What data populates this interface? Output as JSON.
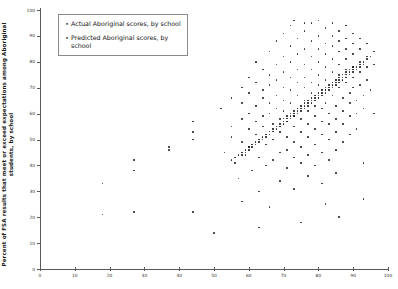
{
  "chart_data": {
    "type": "scatter",
    "title": "",
    "xlabel": "",
    "ylabel": "Percent of FSA results that meet or exceed expectations among Aboriginal students, by school",
    "xlim": [
      0,
      100
    ],
    "ylim": [
      0,
      100
    ],
    "xticks": [
      0,
      10,
      20,
      30,
      40,
      50,
      60,
      70,
      80,
      90,
      100
    ],
    "yticks": [
      0,
      10,
      20,
      30,
      40,
      50,
      60,
      70,
      80,
      90,
      100
    ],
    "grid": false,
    "legend_position": "upper-left",
    "series": [
      {
        "name": "Actual Aboriginal scores, by school",
        "marker": "dot",
        "color": "#2b2b2b",
        "points": [
          [
            18,
            33
          ],
          [
            18,
            21
          ],
          [
            27,
            42
          ],
          [
            27,
            38
          ],
          [
            27,
            22
          ],
          [
            37,
            47
          ],
          [
            37,
            46
          ],
          [
            44,
            57
          ],
          [
            44,
            53
          ],
          [
            44,
            50
          ],
          [
            44,
            22
          ],
          [
            52,
            62
          ],
          [
            53,
            45
          ],
          [
            55,
            66
          ],
          [
            55,
            55
          ],
          [
            55,
            51
          ],
          [
            56,
            41
          ],
          [
            57,
            35
          ],
          [
            58,
            70
          ],
          [
            58,
            64
          ],
          [
            58,
            58
          ],
          [
            58,
            49
          ],
          [
            59,
            44
          ],
          [
            60,
            74
          ],
          [
            60,
            68
          ],
          [
            60,
            60
          ],
          [
            60,
            54
          ],
          [
            60,
            47
          ],
          [
            61,
            38
          ],
          [
            62,
            80
          ],
          [
            62,
            72
          ],
          [
            62,
            63
          ],
          [
            62,
            57
          ],
          [
            62,
            52
          ],
          [
            63,
            43
          ],
          [
            63,
            30
          ],
          [
            64,
            77
          ],
          [
            64,
            69
          ],
          [
            64,
            66
          ],
          [
            64,
            59
          ],
          [
            64,
            55
          ],
          [
            65,
            48
          ],
          [
            65,
            40
          ],
          [
            66,
            84
          ],
          [
            66,
            75
          ],
          [
            66,
            71
          ],
          [
            66,
            64
          ],
          [
            66,
            60
          ],
          [
            67,
            56
          ],
          [
            67,
            50
          ],
          [
            67,
            42
          ],
          [
            68,
            88
          ],
          [
            68,
            79
          ],
          [
            68,
            73
          ],
          [
            68,
            67
          ],
          [
            68,
            62
          ],
          [
            69,
            58
          ],
          [
            69,
            53
          ],
          [
            69,
            45
          ],
          [
            69,
            34
          ],
          [
            70,
            91
          ],
          [
            70,
            82
          ],
          [
            70,
            76
          ],
          [
            70,
            70
          ],
          [
            70,
            65
          ],
          [
            70,
            61
          ],
          [
            71,
            57
          ],
          [
            71,
            51
          ],
          [
            71,
            46
          ],
          [
            71,
            39
          ],
          [
            72,
            94
          ],
          [
            72,
            86
          ],
          [
            72,
            80
          ],
          [
            72,
            74
          ],
          [
            72,
            69
          ],
          [
            72,
            64
          ],
          [
            73,
            59
          ],
          [
            73,
            55
          ],
          [
            73,
            49
          ],
          [
            73,
            43
          ],
          [
            73,
            31
          ],
          [
            74,
            89
          ],
          [
            74,
            83
          ],
          [
            74,
            77
          ],
          [
            74,
            72
          ],
          [
            74,
            67
          ],
          [
            74,
            62
          ],
          [
            75,
            58
          ],
          [
            75,
            53
          ],
          [
            75,
            47
          ],
          [
            75,
            41
          ],
          [
            76,
            92
          ],
          [
            76,
            85
          ],
          [
            76,
            79
          ],
          [
            76,
            74
          ],
          [
            76,
            70
          ],
          [
            76,
            65
          ],
          [
            77,
            61
          ],
          [
            77,
            56
          ],
          [
            77,
            51
          ],
          [
            77,
            44
          ],
          [
            77,
            36
          ],
          [
            78,
            95
          ],
          [
            78,
            88
          ],
          [
            78,
            82
          ],
          [
            78,
            77
          ],
          [
            78,
            72
          ],
          [
            78,
            68
          ],
          [
            79,
            63
          ],
          [
            79,
            59
          ],
          [
            79,
            54
          ],
          [
            79,
            48
          ],
          [
            79,
            40
          ],
          [
            80,
            96
          ],
          [
            80,
            90
          ],
          [
            80,
            85
          ],
          [
            80,
            80
          ],
          [
            80,
            75
          ],
          [
            80,
            71
          ],
          [
            80,
            66
          ],
          [
            81,
            62
          ],
          [
            81,
            57
          ],
          [
            81,
            52
          ],
          [
            81,
            45
          ],
          [
            81,
            33
          ],
          [
            82,
            93
          ],
          [
            82,
            87
          ],
          [
            82,
            83
          ],
          [
            82,
            78
          ],
          [
            82,
            73
          ],
          [
            82,
            69
          ],
          [
            82,
            64
          ],
          [
            83,
            60
          ],
          [
            83,
            56
          ],
          [
            83,
            50
          ],
          [
            83,
            42
          ],
          [
            84,
            95
          ],
          [
            84,
            90
          ],
          [
            84,
            86
          ],
          [
            84,
            81
          ],
          [
            84,
            76
          ],
          [
            84,
            72
          ],
          [
            84,
            67
          ],
          [
            85,
            63
          ],
          [
            85,
            58
          ],
          [
            85,
            53
          ],
          [
            85,
            46
          ],
          [
            85,
            37
          ],
          [
            86,
            92
          ],
          [
            86,
            88
          ],
          [
            86,
            84
          ],
          [
            86,
            79
          ],
          [
            86,
            75
          ],
          [
            86,
            70
          ],
          [
            87,
            66
          ],
          [
            87,
            61
          ],
          [
            87,
            56
          ],
          [
            87,
            49
          ],
          [
            88,
            94
          ],
          [
            88,
            89
          ],
          [
            88,
            85
          ],
          [
            88,
            81
          ],
          [
            88,
            77
          ],
          [
            88,
            72
          ],
          [
            89,
            68
          ],
          [
            89,
            64
          ],
          [
            89,
            59
          ],
          [
            89,
            52
          ],
          [
            90,
            91
          ],
          [
            90,
            87
          ],
          [
            90,
            83
          ],
          [
            90,
            78
          ],
          [
            90,
            74
          ],
          [
            90,
            70
          ],
          [
            91,
            65
          ],
          [
            91,
            60
          ],
          [
            91,
            54
          ],
          [
            92,
            89
          ],
          [
            92,
            85
          ],
          [
            92,
            80
          ],
          [
            92,
            76
          ],
          [
            92,
            71
          ],
          [
            93,
            67
          ],
          [
            93,
            62
          ],
          [
            93,
            41
          ],
          [
            93,
            27
          ],
          [
            94,
            87
          ],
          [
            94,
            82
          ],
          [
            94,
            78
          ],
          [
            94,
            73
          ],
          [
            95,
            69
          ],
          [
            96,
            84
          ],
          [
            96,
            79
          ],
          [
            96,
            60
          ],
          [
            50,
            14
          ],
          [
            63,
            16
          ],
          [
            75,
            18
          ],
          [
            86,
            20
          ],
          [
            73,
            96
          ],
          [
            76,
            95
          ],
          [
            88,
            94
          ],
          [
            58,
            26
          ],
          [
            66,
            24
          ],
          [
            82,
            25
          ]
        ]
      },
      {
        "name": "Predicted Aboriginal scores, by school",
        "marker": "dot",
        "color": "#1f1f1f",
        "points": [
          [
            55,
            42
          ],
          [
            56,
            43
          ],
          [
            57,
            44
          ],
          [
            58,
            45
          ],
          [
            58,
            44
          ],
          [
            59,
            46
          ],
          [
            59,
            45
          ],
          [
            60,
            47
          ],
          [
            60,
            46
          ],
          [
            61,
            48
          ],
          [
            61,
            47
          ],
          [
            62,
            49
          ],
          [
            62,
            48
          ],
          [
            63,
            50
          ],
          [
            63,
            49
          ],
          [
            64,
            51
          ],
          [
            64,
            50
          ],
          [
            65,
            52
          ],
          [
            65,
            51
          ],
          [
            66,
            53
          ],
          [
            66,
            52
          ],
          [
            67,
            54
          ],
          [
            67,
            53
          ],
          [
            68,
            55
          ],
          [
            68,
            54
          ],
          [
            69,
            56
          ],
          [
            69,
            55
          ],
          [
            70,
            57
          ],
          [
            70,
            56
          ],
          [
            70,
            58
          ],
          [
            71,
            58
          ],
          [
            71,
            57
          ],
          [
            71,
            59
          ],
          [
            72,
            59
          ],
          [
            72,
            58
          ],
          [
            72,
            60
          ],
          [
            73,
            60
          ],
          [
            73,
            59
          ],
          [
            73,
            61
          ],
          [
            74,
            61
          ],
          [
            74,
            60
          ],
          [
            74,
            62
          ],
          [
            75,
            62
          ],
          [
            75,
            61
          ],
          [
            75,
            63
          ],
          [
            76,
            63
          ],
          [
            76,
            62
          ],
          [
            76,
            64
          ],
          [
            77,
            64
          ],
          [
            77,
            63
          ],
          [
            77,
            65
          ],
          [
            78,
            65
          ],
          [
            78,
            64
          ],
          [
            78,
            66
          ],
          [
            79,
            66
          ],
          [
            79,
            65
          ],
          [
            79,
            67
          ],
          [
            80,
            67
          ],
          [
            80,
            66
          ],
          [
            80,
            68
          ],
          [
            81,
            68
          ],
          [
            81,
            67
          ],
          [
            81,
            69
          ],
          [
            82,
            69
          ],
          [
            82,
            68
          ],
          [
            82,
            70
          ],
          [
            83,
            70
          ],
          [
            83,
            69
          ],
          [
            83,
            71
          ],
          [
            84,
            71
          ],
          [
            84,
            70
          ],
          [
            84,
            72
          ],
          [
            85,
            72
          ],
          [
            85,
            71
          ],
          [
            85,
            73
          ],
          [
            86,
            73
          ],
          [
            86,
            72
          ],
          [
            86,
            74
          ],
          [
            87,
            74
          ],
          [
            87,
            73
          ],
          [
            87,
            75
          ],
          [
            88,
            75
          ],
          [
            88,
            74
          ],
          [
            88,
            76
          ],
          [
            89,
            76
          ],
          [
            89,
            75
          ],
          [
            89,
            77
          ],
          [
            90,
            77
          ],
          [
            90,
            76
          ],
          [
            90,
            78
          ],
          [
            91,
            78
          ],
          [
            91,
            77
          ],
          [
            92,
            79
          ],
          [
            92,
            78
          ],
          [
            93,
            80
          ],
          [
            93,
            79
          ],
          [
            94,
            81
          ],
          [
            95,
            82
          ]
        ]
      }
    ]
  },
  "legend": {
    "marker_glyph": "•",
    "entries": [
      {
        "label": "Actual Aboriginal scores, by school"
      },
      {
        "label": "Predicted Aboriginal scores, by school"
      }
    ]
  }
}
